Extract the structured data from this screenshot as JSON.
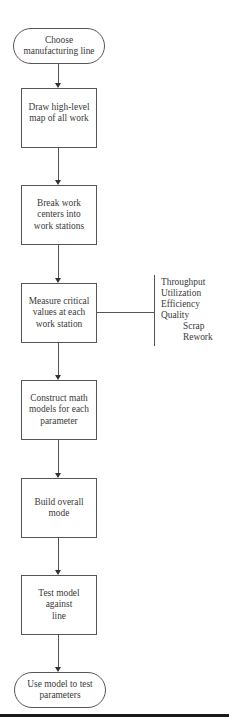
{
  "flowchart": {
    "start": {
      "label": "Choose\nmanufacturing line",
      "shape": "terminal"
    },
    "steps": [
      {
        "label": "Draw high-level\nmap of all work",
        "shape": "process"
      },
      {
        "label": "Break work\ncenters into\nwork stations",
        "shape": "process"
      },
      {
        "label": "Measure critical\nvalues at each\nwork station",
        "shape": "process"
      },
      {
        "label": "Construct math\nmodels for each\nparameter",
        "shape": "process"
      },
      {
        "label": "Build overall\nmode",
        "shape": "process"
      },
      {
        "label": "Test model\nagainst\nline",
        "shape": "process"
      }
    ],
    "end": {
      "label": "Use model to test\nparameters",
      "shape": "terminal"
    },
    "annotation": {
      "attached_to_step": 2,
      "items": [
        "Throughput",
        "Utilization",
        "Efficiency",
        "Quality"
      ],
      "sub_items": [
        "Scrap",
        "Rework"
      ]
    }
  },
  "colors": {
    "line": "#555555",
    "text": "#3a3a3a",
    "rule": "#1a1a1a"
  }
}
